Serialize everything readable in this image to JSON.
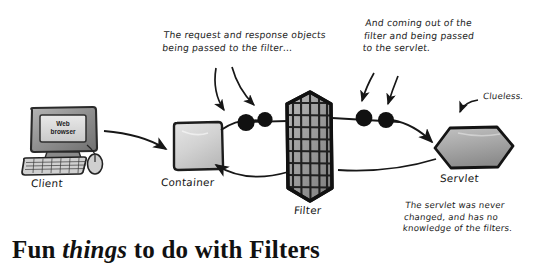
{
  "figure": {
    "title": "Fun things to do with Filters",
    "title_parts": {
      "word1": "Fun ",
      "word2": "things",
      "word3": " to do with Filters"
    },
    "background_color": "#ffffff",
    "ink_color": "#1a1a1a"
  },
  "nodes": {
    "client": {
      "label": "Client",
      "screen_line1": "Web",
      "screen_line2": "browser",
      "shape": "desktop-computer",
      "color": "#8e8e8e"
    },
    "container": {
      "label": "Container",
      "shape": "rounded-square",
      "color": "#d8d8d8"
    },
    "filter": {
      "label": "Filter",
      "shape": "mesh-hexagon",
      "color": "#9a9a9a"
    },
    "servlet": {
      "label": "Servlet",
      "shape": "hexagon",
      "color": "#a9a9a9"
    }
  },
  "flow": {
    "request_objects_count": 2,
    "response_objects_count": 2,
    "object_color": "#111111",
    "request_path": "client-to-container-to-filter-to-servlet",
    "response_path": "servlet-to-filter-to-container"
  },
  "annotations": {
    "request_note": {
      "line1": "The request and response objects",
      "line2": "being passed to the filter…",
      "arrows": 2
    },
    "servlet_note": {
      "line1": "And coming out of the",
      "line2": "filter and being passed",
      "line3": "to the servlet.",
      "arrows": 2
    },
    "clueless_note": {
      "line1": "Clueless.",
      "arrows": 1
    },
    "unchanged_note": {
      "line1": "The servlet was never",
      "line2": "changed, and has no",
      "line3": "knowledge of the filters.",
      "arrows": 0
    }
  }
}
